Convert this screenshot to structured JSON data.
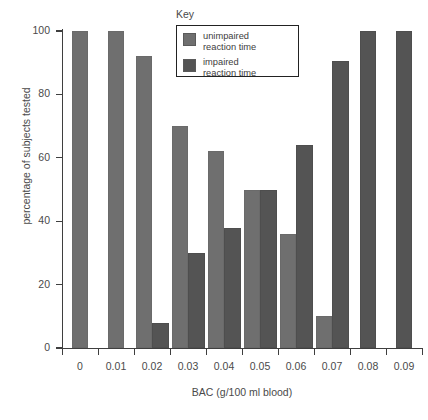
{
  "chart_data": {
    "type": "bar",
    "title": "",
    "xlabel": "BAC (g/100 ml blood)",
    "ylabel": "percentage of subjects tested",
    "categories": [
      "0",
      "0.01",
      "0.02",
      "0.03",
      "0.04",
      "0.05",
      "0.06",
      "0.07",
      "0.08",
      "0.09"
    ],
    "series": [
      {
        "name": "unimpaired\nreaction time",
        "color": "#6f6f6f",
        "values": [
          100,
          100,
          92,
          70,
          62,
          50,
          36,
          10,
          null,
          null
        ]
      },
      {
        "name": "impaired\nreaction time",
        "color": "#545454",
        "values": [
          null,
          null,
          8,
          30,
          38,
          50,
          64,
          90.5,
          100,
          100
        ]
      }
    ],
    "ylim": [
      0,
      100
    ],
    "yticks": [
      "0",
      "20",
      "40",
      "60",
      "80",
      "100"
    ],
    "ytick_values": [
      0,
      20,
      40,
      60,
      80,
      100
    ],
    "grid": false,
    "legend_position": "top-center",
    "legend_title": "Key"
  },
  "legend": {
    "title": "Key",
    "entries": [
      {
        "label": "unimpaired\nreaction time",
        "color": "#6f6f6f"
      },
      {
        "label": "impaired\nreaction time",
        "color": "#545454"
      }
    ]
  },
  "axes": {
    "x_title": "BAC (g/100 ml blood)",
    "y_title": "percentage of subjects tested"
  },
  "caption": {
    "text": ""
  }
}
